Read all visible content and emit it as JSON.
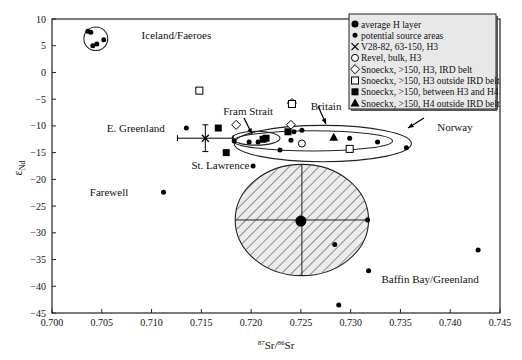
{
  "chart_data": {
    "type": "scatter",
    "title": "",
    "xlabel": "87Sr/86Sr",
    "xlabel_parts": {
      "sup1": "87",
      "base1": "Sr/",
      "sup2": "86",
      "base2": "Sr"
    },
    "ylabel": "εNd",
    "ylabel_parts": {
      "base": "ε",
      "sub": "Nd"
    },
    "xlim": [
      0.7,
      0.745
    ],
    "ylim": [
      -45,
      10
    ],
    "xticks": [
      "0.700",
      "0.705",
      "0.710",
      "0.715",
      "0.720",
      "0.725",
      "0.730",
      "0.735",
      "0.740",
      "0.745"
    ],
    "yticks": [
      "10",
      "5",
      "0",
      "−5",
      "−10",
      "−15",
      "−20",
      "−25",
      "−30",
      "−35",
      "−40",
      "−45"
    ],
    "xtick_values": [
      0.7,
      0.705,
      0.71,
      0.715,
      0.72,
      0.725,
      0.73,
      0.735,
      0.74,
      0.745
    ],
    "ytick_values": [
      10,
      5,
      0,
      -5,
      -10,
      -15,
      -20,
      -25,
      -30,
      -35,
      -40,
      -45
    ],
    "grid": false,
    "legend_position": "top-right",
    "legend": [
      {
        "marker": "big-dot",
        "label": "average H layer"
      },
      {
        "marker": "dot",
        "label": "potential source areas"
      },
      {
        "marker": "cross",
        "label": "V28-82, 63-150, H3"
      },
      {
        "marker": "open-circle",
        "label": "Revel, bulk, H3"
      },
      {
        "marker": "open-diamond",
        "label": "Snoeckx, >150, H3, IRD belt"
      },
      {
        "marker": "open-square",
        "label": "Snoeckx, >150, H3 outside IRD belt"
      },
      {
        "marker": "filled-square",
        "label": "Snoeckx, >150, between H3 and H4"
      },
      {
        "marker": "filled-triangle",
        "label": "Snoeckx, >150, H4 outside IRD belt"
      }
    ],
    "series": [
      {
        "name": "average H layer",
        "marker": "big-dot",
        "points": [
          [
            0.725,
            -27.8
          ]
        ]
      },
      {
        "name": "potential source areas",
        "marker": "dot",
        "points": [
          [
            0.7036,
            7.7
          ],
          [
            0.7039,
            7.5
          ],
          [
            0.7041,
            5.0
          ],
          [
            0.7045,
            5.3
          ],
          [
            0.7052,
            6.1
          ],
          [
            0.7135,
            -10.4
          ],
          [
            0.7112,
            -22.4
          ],
          [
            0.7183,
            -12.8
          ],
          [
            0.7198,
            -13.0
          ],
          [
            0.7207,
            -13.0
          ],
          [
            0.7243,
            -11.1
          ],
          [
            0.7251,
            -10.8
          ],
          [
            0.724,
            -12.7
          ],
          [
            0.7229,
            -14.5
          ],
          [
            0.7299,
            -12.3
          ],
          [
            0.7327,
            -13.0
          ],
          [
            0.7356,
            -14.1
          ],
          [
            0.7202,
            -17.5
          ],
          [
            0.7317,
            -27.6
          ],
          [
            0.7284,
            -32.2
          ],
          [
            0.7318,
            -37.1
          ],
          [
            0.7288,
            -43.5
          ],
          [
            0.7428,
            -33.2
          ]
        ]
      },
      {
        "name": "V28-82, 63-150, H3",
        "marker": "cross",
        "points": [
          [
            0.7154,
            -12.3
          ]
        ],
        "xerr": 0.0028,
        "yerr": 2.5
      },
      {
        "name": "Revel, bulk, H3",
        "marker": "open-circle",
        "points": [
          [
            0.7251,
            -13.3
          ]
        ]
      },
      {
        "name": "Snoeckx, >150, H3, IRD belt",
        "marker": "open-diamond",
        "points": [
          [
            0.7185,
            -9.8
          ],
          [
            0.724,
            -9.8
          ],
          [
            0.7241,
            -5.7
          ]
        ]
      },
      {
        "name": "Snoeckx, >150, H3 outside IRD belt",
        "marker": "open-square",
        "points": [
          [
            0.7148,
            -3.4
          ],
          [
            0.7241,
            -5.9
          ],
          [
            0.7299,
            -14.3
          ]
        ]
      },
      {
        "name": "Snoeckx, >150, between H3 and H4",
        "marker": "filled-square",
        "points": [
          [
            0.7167,
            -10.4
          ],
          [
            0.7175,
            -15.0
          ],
          [
            0.7212,
            -12.5
          ],
          [
            0.7215,
            -12.3
          ],
          [
            0.7237,
            -11.1
          ]
        ]
      },
      {
        "name": "Snoeckx, >150, H4 outside IRD belt",
        "marker": "filled-triangle",
        "points": [
          [
            0.7283,
            -12.1
          ]
        ]
      }
    ],
    "regions": [
      {
        "name": "iceland-faeroes-field",
        "cx": 0.7044,
        "cy": 6.3,
        "rx": 0.0012,
        "ry": 2.2,
        "hatched": false
      },
      {
        "name": "fram-strait-field",
        "cx": 0.7205,
        "cy": -12.3,
        "rx": 0.0024,
        "ry": 1.3,
        "hatched": false
      },
      {
        "name": "britain-field",
        "cx": 0.7262,
        "cy": -12.8,
        "rx": 0.008,
        "ry": 1.9,
        "hatched": false
      },
      {
        "name": "norway-field",
        "cx": 0.7272,
        "cy": -13.3,
        "rx": 0.0089,
        "ry": 3.4,
        "hatched": false
      },
      {
        "name": "average-h-layer-field",
        "cx": 0.7251,
        "cy": -27.6,
        "rx": 0.0067,
        "ry": 10.4,
        "hatched": true
      }
    ],
    "annotations": [
      {
        "text": "Iceland/Faeroes",
        "x": 0.709,
        "y": 7.0
      },
      {
        "text": "E. Greenland",
        "x": 0.7055,
        "y": -10.3
      },
      {
        "text": "Fram Strait",
        "x": 0.7172,
        "y": -7.3
      },
      {
        "text": "Britain",
        "x": 0.726,
        "y": -6.3
      },
      {
        "text": "Norway",
        "x": 0.7387,
        "y": -10.2
      },
      {
        "text": "St. Lawrence",
        "x": 0.714,
        "y": -17.3
      },
      {
        "text": "Farewell",
        "x": 0.7038,
        "y": -22.4
      },
      {
        "text": "Baffin Bay/Greenland",
        "x": 0.7331,
        "y": -38.6
      }
    ]
  }
}
